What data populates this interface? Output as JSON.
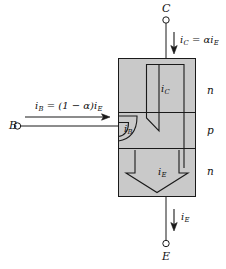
{
  "figure": {
    "type": "npn-transistor-current-diagram",
    "background_color": "#ffffff",
    "body_fill_color": "#c9c9c9",
    "line_color": "#1a1a1a"
  },
  "terminals": {
    "collector": {
      "name": "C",
      "label": "C",
      "position": "top"
    },
    "base": {
      "name": "B",
      "label": "B",
      "position": "left"
    },
    "emitter": {
      "name": "E",
      "label": "E",
      "position": "bottom"
    }
  },
  "layers": [
    {
      "id": "collector-layer",
      "label": "n"
    },
    {
      "id": "base-layer",
      "label": "p"
    },
    {
      "id": "emitter-layer",
      "label": "n"
    }
  ],
  "currents": {
    "collector_external": {
      "symbol": "i",
      "sub": "C",
      "equation_lhs": "i",
      "equation_lhs_sub": "C",
      "equation_rhs": "αi",
      "equation_rhs_sub": "E",
      "full_text": "iC = αiE"
    },
    "base_external": {
      "symbol": "i",
      "sub": "B",
      "equation_lhs": "i",
      "equation_lhs_sub": "B",
      "equation_rhs": "(1 − α)i",
      "equation_rhs_sub": "E",
      "full_text": "iB = (1 − α)iE"
    },
    "emitter_external": {
      "symbol": "i",
      "sub": "E",
      "full_text": "iE"
    },
    "collector_internal": {
      "symbol": "i",
      "sub": "C",
      "full_text": "iC"
    },
    "base_internal": {
      "symbol": "i",
      "sub": "B",
      "full_text": "iB"
    },
    "emitter_internal": {
      "symbol": "i",
      "sub": "E",
      "full_text": "iE"
    }
  }
}
